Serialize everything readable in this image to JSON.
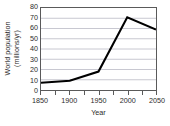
{
  "chart_data": {
    "type": "line",
    "title": "",
    "xlabel": "Year",
    "ylabel_line1": "World population",
    "ylabel_line2": "(millions/yr)",
    "x": [
      1850,
      1900,
      1950,
      2000,
      2050
    ],
    "values": [
      7,
      9,
      18,
      71,
      59
    ],
    "series": [
      {
        "name": "World population",
        "values": [
          7,
          9,
          18,
          71,
          59
        ],
        "color": "#000000"
      }
    ],
    "xlim": [
      1850,
      2050
    ],
    "ylim": [
      0,
      80
    ],
    "xticks_major": [
      1850,
      1900,
      1950,
      2000,
      2050
    ],
    "xticks_major_labels": [
      "1850",
      "1900",
      "1950",
      "2000",
      "2050"
    ],
    "xticks_minor": [
      1875,
      1925,
      1975,
      2025
    ],
    "yticks": [
      0,
      10,
      20,
      30,
      40,
      50,
      60,
      70,
      80
    ],
    "ytick_labels": [
      "0",
      "10",
      "20",
      "30",
      "40",
      "50",
      "60",
      "70",
      "80"
    ],
    "grid": "horizontal",
    "grid_color": "#b8b8c4",
    "frame_color": "#5a5a5a",
    "legend": "none"
  }
}
